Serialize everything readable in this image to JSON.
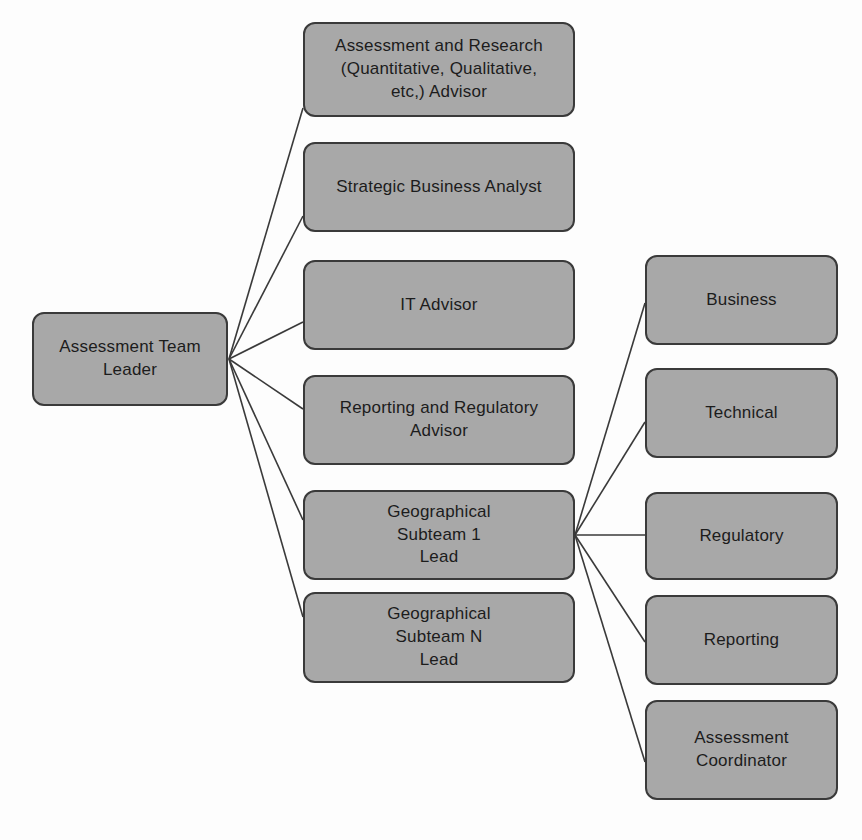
{
  "diagram": {
    "type": "org-chart",
    "colors": {
      "node_fill": "#a8a8a8",
      "node_border": "#3a3a3a",
      "text": "#1c1c1c",
      "edge": "#3a3a3a",
      "background": "#fdfdfd"
    },
    "nodes": [
      {
        "id": "team-leader",
        "label": "Assessment Team\nLeader",
        "column": "left",
        "x": 32,
        "y": 312,
        "w": 196,
        "h": 94
      },
      {
        "id": "assessment-research-advisor",
        "label": "Assessment and Research\n(Quantitative, Qualitative,\netc,) Advisor",
        "column": "middle",
        "x": 303,
        "y": 22,
        "w": 272,
        "h": 95
      },
      {
        "id": "strategic-business-analyst",
        "label": "Strategic Business Analyst",
        "column": "middle",
        "x": 303,
        "y": 142,
        "w": 272,
        "h": 90
      },
      {
        "id": "it-advisor",
        "label": "IT Advisor",
        "column": "middle",
        "x": 303,
        "y": 260,
        "w": 272,
        "h": 90
      },
      {
        "id": "reporting-regulatory-advisor",
        "label": "Reporting and Regulatory\nAdvisor",
        "column": "middle",
        "x": 303,
        "y": 375,
        "w": 272,
        "h": 90
      },
      {
        "id": "geo-subteam-1-lead",
        "label": "Geographical\nSubteam 1\nLead",
        "column": "middle",
        "x": 303,
        "y": 490,
        "w": 272,
        "h": 90
      },
      {
        "id": "geo-subteam-n-lead",
        "label": "Geographical\nSubteam N\nLead",
        "column": "middle",
        "x": 303,
        "y": 592,
        "w": 272,
        "h": 91
      },
      {
        "id": "business",
        "label": "Business",
        "column": "right",
        "x": 645,
        "y": 255,
        "w": 193,
        "h": 90
      },
      {
        "id": "technical",
        "label": "Technical",
        "column": "right",
        "x": 645,
        "y": 368,
        "w": 193,
        "h": 90
      },
      {
        "id": "regulatory",
        "label": "Regulatory",
        "column": "right",
        "x": 645,
        "y": 492,
        "w": 193,
        "h": 88
      },
      {
        "id": "reporting",
        "label": "Reporting",
        "column": "right",
        "x": 645,
        "y": 595,
        "w": 193,
        "h": 90
      },
      {
        "id": "assessment-coordinator",
        "label": "Assessment\nCoordinator",
        "column": "right",
        "x": 645,
        "y": 700,
        "w": 193,
        "h": 100
      }
    ],
    "edges": [
      {
        "from": "team-leader",
        "to": "assessment-research-advisor",
        "x1": 229,
        "y1": 359,
        "x2": 303,
        "y2": 108
      },
      {
        "from": "team-leader",
        "to": "strategic-business-analyst",
        "x1": 229,
        "y1": 359,
        "x2": 303,
        "y2": 216
      },
      {
        "from": "team-leader",
        "to": "it-advisor",
        "x1": 229,
        "y1": 359,
        "x2": 303,
        "y2": 322
      },
      {
        "from": "team-leader",
        "to": "reporting-regulatory-advisor",
        "x1": 229,
        "y1": 359,
        "x2": 303,
        "y2": 409
      },
      {
        "from": "team-leader",
        "to": "geo-subteam-1-lead",
        "x1": 229,
        "y1": 359,
        "x2": 303,
        "y2": 520
      },
      {
        "from": "team-leader",
        "to": "geo-subteam-n-lead",
        "x1": 229,
        "y1": 359,
        "x2": 303,
        "y2": 617
      },
      {
        "from": "geo-subteam-1-lead",
        "to": "business",
        "x1": 575,
        "y1": 535,
        "x2": 645,
        "y2": 303
      },
      {
        "from": "geo-subteam-1-lead",
        "to": "technical",
        "x1": 575,
        "y1": 535,
        "x2": 645,
        "y2": 422
      },
      {
        "from": "geo-subteam-1-lead",
        "to": "regulatory",
        "x1": 575,
        "y1": 535,
        "x2": 645,
        "y2": 535
      },
      {
        "from": "geo-subteam-1-lead",
        "to": "reporting",
        "x1": 575,
        "y1": 535,
        "x2": 645,
        "y2": 642
      },
      {
        "from": "geo-subteam-1-lead",
        "to": "assessment-coordinator",
        "x1": 575,
        "y1": 535,
        "x2": 645,
        "y2": 762
      }
    ]
  }
}
